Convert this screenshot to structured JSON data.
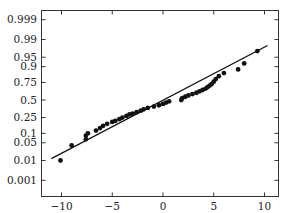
{
  "chart_data": {
    "type": "scatter",
    "title": "",
    "xlabel": "",
    "ylabel": "",
    "y_scale": "normal-probability",
    "grid": false,
    "legend": null,
    "xlim": [
      -12.0,
      11.3
    ],
    "x_ticks": [
      -10,
      -5,
      0,
      5,
      10
    ],
    "x_tick_labels": [
      "−10",
      "−5",
      "0",
      "5",
      "10"
    ],
    "y_ticks": [
      0.999,
      0.99,
      0.95,
      0.9,
      0.75,
      0.5,
      0.25,
      0.1,
      0.05,
      0.01,
      0.001
    ],
    "y_tick_labels": [
      "0.999",
      "0.99",
      "0.95",
      "0.9",
      "0.75",
      "0.5",
      "0.25",
      "0.1",
      "0.05",
      "0.01",
      "0.001"
    ],
    "fit_line": {
      "x": [
        -11.0,
        10.3
      ],
      "p": [
        0.012,
        0.982
      ]
    },
    "series": [
      {
        "name": "samples",
        "points": [
          [
            -10.1,
            0.01
          ],
          [
            -9.0,
            0.04
          ],
          [
            -7.6,
            0.065
          ],
          [
            -7.6,
            0.085
          ],
          [
            -7.4,
            0.1
          ],
          [
            -6.6,
            0.12
          ],
          [
            -6.2,
            0.14
          ],
          [
            -5.9,
            0.16
          ],
          [
            -5.5,
            0.18
          ],
          [
            -5.0,
            0.2
          ],
          [
            -4.7,
            0.21
          ],
          [
            -4.3,
            0.23
          ],
          [
            -4.0,
            0.25
          ],
          [
            -3.6,
            0.27
          ],
          [
            -3.3,
            0.29
          ],
          [
            -3.0,
            0.3
          ],
          [
            -2.6,
            0.32
          ],
          [
            -2.2,
            0.34
          ],
          [
            -1.9,
            0.36
          ],
          [
            -1.5,
            0.38
          ],
          [
            -0.9,
            0.4
          ],
          [
            -0.4,
            0.42
          ],
          [
            0.0,
            0.44
          ],
          [
            0.3,
            0.46
          ],
          [
            0.6,
            0.48
          ],
          [
            1.8,
            0.5
          ],
          [
            1.9,
            0.53
          ],
          [
            2.2,
            0.55
          ],
          [
            2.5,
            0.57
          ],
          [
            2.9,
            0.59
          ],
          [
            3.3,
            0.61
          ],
          [
            3.6,
            0.63
          ],
          [
            3.9,
            0.65
          ],
          [
            4.2,
            0.67
          ],
          [
            4.4,
            0.69
          ],
          [
            4.6,
            0.71
          ],
          [
            4.8,
            0.73
          ],
          [
            5.0,
            0.76
          ],
          [
            5.2,
            0.79
          ],
          [
            5.5,
            0.82
          ],
          [
            6.0,
            0.85
          ],
          [
            7.4,
            0.88
          ],
          [
            8.0,
            0.92
          ],
          [
            9.3,
            0.97
          ]
        ]
      }
    ]
  }
}
